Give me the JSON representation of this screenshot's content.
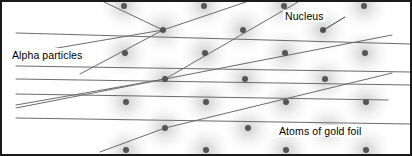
{
  "figure": {
    "frame_color": "#1a1a1a",
    "background_color": "#ffffff",
    "beam_color": "#6b6b6b",
    "nucleus_color": "#555555",
    "atom_cloud_color": "#d9d9d9"
  },
  "labels": {
    "alpha_particles": "Alpha particles",
    "nucleus": "Nucleus",
    "atoms_of_gold_foil": "Atoms of gold foil"
  },
  "chart_data": {
    "type": "scatter",
    "xlabel": "",
    "ylabel": "",
    "xlim": [
      0,
      412
    ],
    "ylim": [
      0,
      156
    ],
    "grid": false,
    "legend": "none",
    "annotations": [
      {
        "text": "Alpha particles",
        "x": 10,
        "y": 55
      },
      {
        "text": "Nucleus",
        "x": 285,
        "y": 18
      },
      {
        "text": "Atoms of gold foil",
        "x": 279,
        "y": 133
      }
    ],
    "atom_radius": 26,
    "nucleus_radius": 3,
    "atoms": [
      {
        "cx": 163,
        "cy": 30
      },
      {
        "cx": 243,
        "cy": 30
      },
      {
        "cx": 323,
        "cy": 30
      },
      {
        "cx": 204,
        "cy": 6
      },
      {
        "cx": 284,
        "cy": 6
      },
      {
        "cx": 364,
        "cy": 6
      },
      {
        "cx": 124,
        "cy": 6
      },
      {
        "cx": 165,
        "cy": 79
      },
      {
        "cx": 245,
        "cy": 79
      },
      {
        "cx": 325,
        "cy": 79
      },
      {
        "cx": 205,
        "cy": 53
      },
      {
        "cx": 285,
        "cy": 53
      },
      {
        "cx": 365,
        "cy": 53
      },
      {
        "cx": 125,
        "cy": 53
      },
      {
        "cx": 165,
        "cy": 128
      },
      {
        "cx": 248,
        "cy": 128
      },
      {
        "cx": 328,
        "cy": 128
      },
      {
        "cx": 206,
        "cy": 102
      },
      {
        "cx": 286,
        "cy": 102
      },
      {
        "cx": 366,
        "cy": 102
      },
      {
        "cx": 126,
        "cy": 102
      },
      {
        "cx": 206,
        "cy": 150
      },
      {
        "cx": 286,
        "cy": 150
      },
      {
        "cx": 366,
        "cy": 150
      },
      {
        "cx": 126,
        "cy": 150
      }
    ],
    "beams": [
      {
        "name": "undeflected-beam-1",
        "points": [
          [
            16,
            33
          ],
          [
            410,
            44
          ]
        ]
      },
      {
        "name": "undeflected-beam-2",
        "points": [
          [
            16,
            66
          ],
          [
            410,
            72
          ]
        ]
      },
      {
        "name": "undeflected-beam-3",
        "points": [
          [
            16,
            79
          ],
          [
            410,
            85
          ]
        ]
      },
      {
        "name": "undeflected-beam-4",
        "points": [
          [
            16,
            94
          ],
          [
            388,
            100
          ]
        ]
      },
      {
        "name": "undeflected-beam-5",
        "points": [
          [
            16,
            118
          ],
          [
            410,
            124
          ]
        ]
      },
      {
        "name": "deflected-beam-top",
        "points": [
          [
            16,
            55
          ],
          [
            163,
            30
          ],
          [
            104,
            2
          ]
        ]
      },
      {
        "name": "deflected-beam-cross",
        "points": [
          [
            80,
            74
          ],
          [
            163,
            30
          ],
          [
            246,
            2
          ]
        ]
      },
      {
        "name": "deflected-beam-mid",
        "points": [
          [
            16,
            108
          ],
          [
            165,
            79
          ],
          [
            298,
            2
          ]
        ]
      },
      {
        "name": "deflected-beam-wide",
        "points": [
          [
            16,
            105
          ],
          [
            165,
            79
          ],
          [
            392,
            35
          ]
        ]
      },
      {
        "name": "deflected-beam-bottom",
        "points": [
          [
            100,
            152
          ],
          [
            165,
            128
          ],
          [
            392,
            73
          ]
        ]
      }
    ],
    "leader_lines": [
      {
        "name": "nucleus-leader",
        "points": [
          [
            322,
            31
          ],
          [
            345,
            17
          ]
        ]
      },
      {
        "name": "atoms-leader",
        "points": [
          [
            328,
            129
          ],
          [
            343,
            131
          ]
        ]
      }
    ]
  }
}
